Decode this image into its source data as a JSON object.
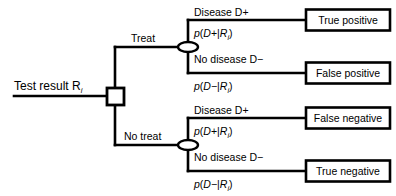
{
  "diagram": {
    "type": "decision-tree",
    "background_color": "#ffffff",
    "line_color": "#000000",
    "root": {
      "label_text": "Test result R",
      "label_subscript": "i",
      "node_type": "decision-square"
    },
    "branches": [
      {
        "id": "treat",
        "label": "Treat",
        "node_type": "chance-ellipse",
        "outcomes": [
          {
            "id": "treat-disease",
            "state_label": "Disease D",
            "state_sign": "+",
            "probability_prefix": "p",
            "probability_open": "(",
            "probability_event": "D",
            "probability_sign": "+",
            "probability_bar": "|",
            "probability_cond": "R",
            "probability_cond_sub": "i",
            "probability_close": ")",
            "result": "True positive"
          },
          {
            "id": "treat-nodisease",
            "state_label": "No disease D",
            "state_sign": "−",
            "probability_prefix": "p",
            "probability_open": "(",
            "probability_event": "D",
            "probability_sign": "−",
            "probability_bar": "|",
            "probability_cond": "R",
            "probability_cond_sub": "i",
            "probability_close": ")",
            "result": "False positive"
          }
        ]
      },
      {
        "id": "no-treat",
        "label": "No treat",
        "node_type": "chance-ellipse",
        "outcomes": [
          {
            "id": "notreat-disease",
            "state_label": "Disease D",
            "state_sign": "+",
            "probability_prefix": "p",
            "probability_open": "(",
            "probability_event": "D",
            "probability_sign": "+",
            "probability_bar": "|",
            "probability_cond": "R",
            "probability_cond_sub": "i",
            "probability_close": ")",
            "result": "False negative"
          },
          {
            "id": "notreat-nodisease",
            "state_label": "No disease D",
            "state_sign": "−",
            "probability_prefix": "p",
            "probability_open": "(",
            "probability_event": "D",
            "probability_sign": "−",
            "probability_bar": "|",
            "probability_cond": "R",
            "probability_cond_sub": "i",
            "probability_close": ")",
            "result": "True negative"
          }
        ]
      }
    ]
  }
}
